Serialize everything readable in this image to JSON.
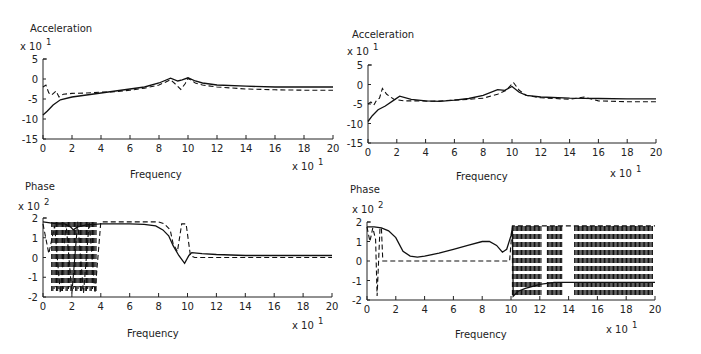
{
  "chart_data": [
    {
      "id": "top-left",
      "type": "line",
      "title": "Acceleration",
      "ylabel": "Acceleration",
      "y_multiplier": "x 10",
      "y_exponent": "1",
      "xlabel": "Frequency",
      "x_multiplier": "x 10",
      "x_exponent": "1",
      "xlim": [
        0,
        20
      ],
      "ylim": [
        -15,
        5
      ],
      "xticks": [
        0,
        2,
        4,
        6,
        8,
        10,
        12,
        14,
        16,
        18,
        20
      ],
      "yticks": [
        5,
        0,
        -5,
        -10,
        -15
      ],
      "grid": false,
      "frame": {
        "x0": 43,
        "x1": 333,
        "y_top": 59,
        "y_bottom": 139,
        "ymax": 5,
        "ymin": -15
      },
      "series": [
        {
          "name": "solid",
          "style": "solid",
          "x": [
            0,
            0.3,
            0.7,
            1.2,
            2,
            3,
            4,
            5,
            6,
            7,
            8,
            8.8,
            9.3,
            9.6,
            10,
            10.5,
            11,
            12,
            14,
            16,
            18,
            20
          ],
          "y": [
            -9,
            -8,
            -6.5,
            -5.2,
            -4.5,
            -4,
            -3.5,
            -3,
            -2.5,
            -2,
            -1,
            0.2,
            -0.5,
            -0.2,
            0.3,
            -0.5,
            -1,
            -1.5,
            -1.8,
            -2,
            -2,
            -2
          ]
        },
        {
          "name": "dashed",
          "style": "dashed",
          "x": [
            0,
            0.2,
            0.4,
            0.6,
            0.9,
            1.1,
            1.4,
            2,
            3,
            4,
            5,
            6,
            7,
            8,
            8.8,
            9.2,
            9.5,
            9.8,
            10,
            10.5,
            11,
            12,
            14,
            16,
            18,
            20
          ],
          "y": [
            -2,
            -1.5,
            -3.5,
            -4,
            -3,
            -4.5,
            -3.8,
            -3.6,
            -3.5,
            -3.3,
            -3.2,
            -2.8,
            -2.3,
            -1.5,
            -0.2,
            -1.5,
            -2.6,
            -1.2,
            0.2,
            -1,
            -1.5,
            -2,
            -2.5,
            -2.7,
            -2.8,
            -2.8
          ]
        }
      ]
    },
    {
      "id": "top-right",
      "type": "line",
      "title": "Acceleration",
      "ylabel": "Acceleration",
      "y_multiplier": "x 10",
      "y_exponent": "1",
      "xlabel": "Frequency",
      "x_multiplier": "x 10",
      "x_exponent": "1",
      "xlim": [
        0,
        20
      ],
      "ylim": [
        -15,
        5
      ],
      "xticks": [
        0,
        2,
        4,
        6,
        8,
        10,
        12,
        14,
        16,
        18,
        20
      ],
      "yticks": [
        5,
        0,
        -5,
        -10,
        -15
      ],
      "grid": false,
      "frame": {
        "x0": 368,
        "x1": 656,
        "y_top": 65,
        "y_bottom": 143,
        "ymax": 5,
        "ymin": -15
      },
      "series": [
        {
          "name": "solid",
          "style": "solid",
          "x": [
            0,
            0.3,
            0.7,
            1.2,
            1.8,
            2.2,
            3,
            4,
            5,
            6,
            7,
            8,
            9,
            9.5,
            10,
            10.5,
            11,
            12,
            14,
            16,
            18,
            20
          ],
          "y": [
            -9.5,
            -8,
            -6.5,
            -5.5,
            -4,
            -3,
            -3.8,
            -4.2,
            -4.3,
            -4,
            -3.6,
            -2.8,
            -1.3,
            -1.5,
            -0.5,
            -2,
            -2.8,
            -3.2,
            -3.5,
            -3.6,
            -3.7,
            -3.7
          ]
        },
        {
          "name": "dashed",
          "style": "dashed",
          "x": [
            0,
            0.2,
            0.4,
            0.6,
            0.8,
            1,
            1.3,
            1.8,
            2.5,
            3.5,
            4.5,
            6,
            7,
            8,
            9,
            9.6,
            10.1,
            10.5,
            11,
            12,
            14,
            15,
            16,
            18,
            20
          ],
          "y": [
            -5,
            -4.5,
            -5.3,
            -4,
            -3.5,
            -1,
            -2.5,
            -3.8,
            -4.2,
            -4.2,
            -4.3,
            -4,
            -3.8,
            -3.5,
            -2.5,
            -1.5,
            0.5,
            -1.5,
            -2.8,
            -3.4,
            -3.8,
            -3.2,
            -4.2,
            -4.4,
            -4.4
          ]
        }
      ]
    },
    {
      "id": "bottom-left",
      "type": "line",
      "title": "Phase",
      "ylabel": "Phase",
      "y_multiplier": "x 10",
      "y_exponent": "2",
      "xlabel": "Frequency",
      "x_multiplier": "x 10",
      "x_exponent": "1",
      "xlim": [
        0,
        20
      ],
      "ylim": [
        -2,
        2
      ],
      "xticks": [
        0,
        2,
        4,
        6,
        8,
        10,
        12,
        14,
        16,
        18,
        20
      ],
      "yticks": [
        2,
        1,
        0,
        -1,
        -2
      ],
      "grid": false,
      "frame": {
        "x0": 43,
        "x1": 332,
        "y_top": 218,
        "y_bottom": 297,
        "ymax": 2,
        "ymin": -2
      },
      "series": [
        {
          "name": "solid",
          "style": "solid",
          "x": [
            0,
            0.5,
            1,
            1.5,
            1.9,
            2.1,
            2.4,
            3,
            4,
            5,
            6,
            7,
            7.8,
            8.3,
            8.7,
            9,
            9.4,
            9.8,
            10.1,
            10.3,
            11,
            12,
            14,
            16,
            18,
            20
          ],
          "y": [
            1.8,
            1.75,
            1.7,
            1.7,
            1.55,
            1.4,
            1.55,
            1.65,
            1.7,
            1.7,
            1.7,
            1.68,
            1.6,
            1.4,
            1.1,
            0.6,
            0.1,
            -0.3,
            0.1,
            0.25,
            0.2,
            0.15,
            0.1,
            0.1,
            0.1,
            0.1
          ]
        },
        {
          "name": "dashed",
          "style": "dashed",
          "x": [
            0,
            0.4,
            0.8,
            1.2,
            1.6,
            2,
            2.4,
            2.8,
            3.2,
            3.6,
            4,
            6,
            8,
            8.4,
            8.8,
            9,
            9.3,
            9.6,
            9.9,
            10.2,
            10.5,
            12,
            14,
            16,
            18,
            20
          ],
          "y": [
            1.7,
            0.2,
            1.6,
            -1.8,
            1.7,
            -1.8,
            1.8,
            -1.8,
            1.8,
            -1.8,
            1.8,
            1.8,
            1.8,
            1.7,
            1.4,
            0.7,
            0.3,
            1.7,
            1.7,
            0.1,
            0.0,
            0.0,
            0.0,
            0.0,
            0.0,
            0.0
          ]
        }
      ],
      "note": "Dashed trace wraps rapidly between +180 and -180 deg for frequencies 0.5-3.7 (x10^1)"
    },
    {
      "id": "bottom-right",
      "type": "line",
      "title": "Phase",
      "ylabel": "Phase",
      "y_multiplier": "x 10",
      "y_exponent": "2",
      "xlabel": "Frequency",
      "x_multiplier": "x 10",
      "x_exponent": "1",
      "xlim": [
        0,
        20
      ],
      "ylim": [
        -2,
        2
      ],
      "xticks": [
        0,
        2,
        4,
        6,
        8,
        10,
        12,
        14,
        16,
        18,
        20
      ],
      "yticks": [
        2,
        1,
        0,
        -1,
        -2
      ],
      "grid": false,
      "frame": {
        "x0": 367,
        "x1": 655,
        "y_top": 222,
        "y_bottom": 300,
        "ymax": 2,
        "ymin": -2
      },
      "series": [
        {
          "name": "solid",
          "style": "solid",
          "x": [
            0,
            0.5,
            1,
            1.5,
            2,
            2.5,
            3,
            3.5,
            4,
            5,
            6,
            7,
            8,
            8.5,
            9,
            9.4,
            9.7,
            10,
            10.1,
            10.15,
            10.5,
            11,
            12,
            13,
            14,
            16,
            18,
            20
          ],
          "y": [
            1.75,
            1.75,
            1.7,
            1.55,
            1.2,
            0.5,
            0.25,
            0.2,
            0.25,
            0.4,
            0.6,
            0.8,
            1.0,
            1.0,
            0.8,
            0.45,
            0.6,
            1.3,
            1.7,
            -1.8,
            -1.55,
            -1.4,
            -1.2,
            -1.1,
            -1.1,
            -1.1,
            -1.1,
            -1.1
          ]
        },
        {
          "name": "dashed",
          "style": "dashed",
          "x": [
            0,
            0.2,
            0.4,
            0.6,
            0.7,
            0.9,
            1.0,
            1.1,
            2,
            4,
            6,
            8,
            9,
            9.9,
            10.1,
            20
          ],
          "y": [
            1.75,
            1.0,
            1.7,
            1.1,
            -1.8,
            1.7,
            1.7,
            0.0,
            0.0,
            0.0,
            0.0,
            0.0,
            0.0,
            0.0,
            1.8,
            1.8
          ]
        }
      ],
      "note": "Dashed trace wraps rapidly between +180 and -180 deg for frequencies 10-20 (x10^1)"
    }
  ],
  "labels": {
    "tl_title": "Acceleration",
    "tr_title": "Acceleration",
    "bl_title": "Phase",
    "br_title": "Phase",
    "freq": "Frequency",
    "xmult": "x 10",
    "exp1": "1",
    "exp2": "2"
  }
}
